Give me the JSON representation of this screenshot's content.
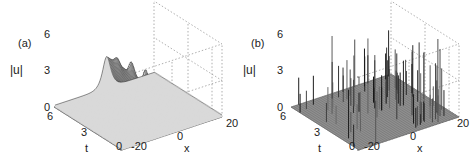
{
  "chart_data": [
    {
      "type": "surface3d",
      "panel": "(a)",
      "title": "",
      "zlabel": "|u|",
      "xlabel": "x",
      "ylabel": "t",
      "x_ticks": [
        "-20",
        "0",
        "20"
      ],
      "t_ticks": [
        "0",
        "3",
        "6"
      ],
      "z_ticks": [
        "0",
        "3",
        "6"
      ],
      "xlim": [
        -25,
        25
      ],
      "tlim": [
        0,
        6
      ],
      "zlim": [
        0,
        6
      ],
      "grid": true,
      "description": "Localized wave ridge near x=0 across t in [0,6] with four periodic peaks reaching about 4.5",
      "peaks": [
        {
          "t": 5.2,
          "x": -2,
          "z": 4.5
        },
        {
          "t": 3.8,
          "x": -1,
          "z": 4.2
        },
        {
          "t": 2.4,
          "x": 0,
          "z": 3.8
        },
        {
          "t": 1.0,
          "x": 1,
          "z": 3.3
        }
      ],
      "baseline": 0.2
    },
    {
      "type": "surface3d",
      "panel": "(b)",
      "title": "",
      "zlabel": "|u|",
      "xlabel": "x",
      "ylabel": "t",
      "x_ticks": [
        "-20",
        "0",
        "20"
      ],
      "t_ticks": [
        "0",
        "3",
        "6"
      ],
      "z_ticks": [
        "0",
        "3",
        "6"
      ],
      "xlim": [
        -25,
        25
      ],
      "tlim": [
        0,
        6
      ],
      "zlim": [
        0,
        6
      ],
      "grid": true,
      "description": "Random rogue-wave-like spikes scattered over the x-t plane, many reaching 4-6",
      "max_spike": 6.5
    }
  ],
  "panels": {
    "a": {
      "tag": "(a)",
      "zlabel": "|u|",
      "xlabel": "x",
      "tlabel": "t",
      "z_ticks": [
        "6",
        "3",
        "0"
      ],
      "t_ticks": [
        "6",
        "3",
        "0"
      ],
      "x_ticks": [
        "-20",
        "0",
        "20"
      ]
    },
    "b": {
      "tag": "(b)",
      "zlabel": "|u|",
      "xlabel": "x",
      "tlabel": "t",
      "z_ticks": [
        "6",
        "3",
        "0"
      ],
      "t_ticks": [
        "6",
        "3",
        "0"
      ],
      "x_ticks": [
        "-20",
        "0",
        "20"
      ]
    }
  }
}
